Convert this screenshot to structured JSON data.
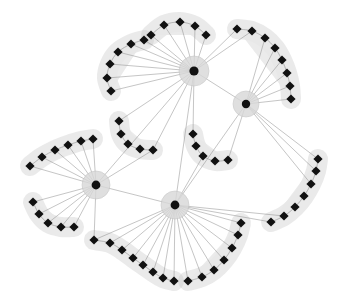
{
  "figure": {
    "title": "",
    "background_color": "#ffffff",
    "width": 350,
    "height": 308
  },
  "style": {
    "edge_color": "#8e8e8e",
    "edge_width": 0.55,
    "blob_fill": "#e8e8e8",
    "blob_stroke": "#c4c4c4",
    "node_color": "#111111",
    "node_size": 4.6,
    "hub_halo_color": "#d8d8d8",
    "hub_core_color": "#111111",
    "hub_core_radius": 4.2,
    "hub_halo_radius": 13
  },
  "chart_data": {
    "type": "scatter",
    "title": "",
    "xlabel": "",
    "ylabel": "",
    "xlim": [
      0,
      350
    ],
    "ylim": [
      0,
      308
    ],
    "grid": false,
    "legend": null,
    "counts": {
      "hubs": 4,
      "clusters": 10,
      "cluster_nodes": 64,
      "hub_hub_edges": 5
    },
    "hubs": [
      {
        "id": "H1",
        "label": "hub-top-center",
        "x": 194,
        "y": 71,
        "halo_r": 15,
        "core_r": 4.6
      },
      {
        "id": "H2",
        "label": "hub-right",
        "x": 246,
        "y": 104,
        "halo_r": 13,
        "core_r": 4.2
      },
      {
        "id": "H3",
        "label": "hub-left",
        "x": 96,
        "y": 185,
        "halo_r": 14,
        "core_r": 4.4
      },
      {
        "id": "H4",
        "label": "hub-bottom-center",
        "x": 175,
        "y": 205,
        "halo_r": 14,
        "core_r": 4.4
      }
    ],
    "hub_edges": [
      {
        "source": "H1",
        "target": "H2"
      },
      {
        "source": "H1",
        "target": "H3"
      },
      {
        "source": "H1",
        "target": "H4"
      },
      {
        "source": "H2",
        "target": "H4"
      },
      {
        "source": "H3",
        "target": "H4"
      }
    ],
    "clusters": [
      {
        "id": "C1",
        "label": "cluster-top-left",
        "attached_to": [
          "H1"
        ],
        "node_count": 6,
        "nodes": [
          [
            111,
            91
          ],
          [
            107,
            78
          ],
          [
            110,
            64
          ],
          [
            118,
            52
          ],
          [
            131,
            44
          ],
          [
            144,
            40
          ]
        ]
      },
      {
        "id": "C2",
        "label": "cluster-top-center",
        "attached_to": [
          "H1"
        ],
        "node_count": 5,
        "nodes": [
          [
            151,
            35
          ],
          [
            164,
            25
          ],
          [
            180,
            22
          ],
          [
            195,
            26
          ],
          [
            206,
            35
          ]
        ]
      },
      {
        "id": "C3",
        "label": "cluster-top-right",
        "attached_to": [
          "H1",
          "H2"
        ],
        "node_count": 8,
        "nodes": [
          [
            237,
            29
          ],
          [
            252,
            31
          ],
          [
            265,
            38
          ],
          [
            275,
            48
          ],
          [
            282,
            60
          ],
          [
            287,
            73
          ],
          [
            290,
            86
          ],
          [
            291,
            99
          ]
        ]
      },
      {
        "id": "C4",
        "label": "cluster-middle-left",
        "attached_to": [
          "H1",
          "H3"
        ],
        "node_count": 5,
        "nodes": [
          [
            119,
            121
          ],
          [
            121,
            134
          ],
          [
            128,
            144
          ],
          [
            140,
            149
          ],
          [
            153,
            150
          ]
        ]
      },
      {
        "id": "C5",
        "label": "cluster-middle-center",
        "attached_to": [
          "H1",
          "H2",
          "H4"
        ],
        "node_count": 5,
        "nodes": [
          [
            193,
            134
          ],
          [
            196,
            146
          ],
          [
            203,
            156
          ],
          [
            215,
            161
          ],
          [
            228,
            160
          ]
        ]
      },
      {
        "id": "C6",
        "label": "cluster-left-upper",
        "attached_to": [
          "H3"
        ],
        "node_count": 6,
        "nodes": [
          [
            30,
            166
          ],
          [
            42,
            157
          ],
          [
            55,
            150
          ],
          [
            68,
            145
          ],
          [
            81,
            141
          ],
          [
            93,
            139
          ]
        ]
      },
      {
        "id": "C7",
        "label": "cluster-left-lower",
        "attached_to": [
          "H3"
        ],
        "node_count": 5,
        "nodes": [
          [
            33,
            202
          ],
          [
            39,
            214
          ],
          [
            48,
            223
          ],
          [
            61,
            227
          ],
          [
            74,
            227
          ]
        ]
      },
      {
        "id": "C8",
        "label": "cluster-bottom-left",
        "attached_to": [
          "H3",
          "H4"
        ],
        "node_count": 8,
        "nodes": [
          [
            94,
            240
          ],
          [
            110,
            243
          ],
          [
            122,
            250
          ],
          [
            133,
            258
          ],
          [
            143,
            265
          ],
          [
            153,
            272
          ],
          [
            163,
            278
          ],
          [
            174,
            281
          ]
        ]
      },
      {
        "id": "C9",
        "label": "cluster-bottom-right",
        "attached_to": [
          "H4"
        ],
        "node_count": 7,
        "nodes": [
          [
            188,
            281
          ],
          [
            202,
            277
          ],
          [
            214,
            270
          ],
          [
            224,
            260
          ],
          [
            232,
            248
          ],
          [
            238,
            235
          ],
          [
            241,
            223
          ]
        ]
      },
      {
        "id": "C10",
        "label": "cluster-right",
        "attached_to": [
          "H2",
          "H4"
        ],
        "node_count": 7,
        "nodes": [
          [
            271,
            222
          ],
          [
            284,
            216
          ],
          [
            295,
            207
          ],
          [
            304,
            196
          ],
          [
            311,
            184
          ],
          [
            316,
            171
          ],
          [
            318,
            159
          ]
        ]
      }
    ],
    "hub_to_cluster_edges": [
      {
        "hub": "H1",
        "cluster": "C1",
        "node_indices": [
          0,
          1,
          2,
          3,
          4,
          5
        ]
      },
      {
        "hub": "H1",
        "cluster": "C2",
        "node_indices": [
          0,
          1,
          2,
          3,
          4
        ]
      },
      {
        "hub": "H1",
        "cluster": "C3",
        "node_indices": [
          0,
          1
        ]
      },
      {
        "hub": "H1",
        "cluster": "C4",
        "node_indices": [
          0,
          4
        ]
      },
      {
        "hub": "H1",
        "cluster": "C5",
        "node_indices": [
          0
        ]
      },
      {
        "hub": "H2",
        "cluster": "C3",
        "node_indices": [
          2,
          3,
          4,
          5,
          6,
          7
        ]
      },
      {
        "hub": "H2",
        "cluster": "C5",
        "node_indices": [
          4
        ]
      },
      {
        "hub": "H2",
        "cluster": "C10",
        "node_indices": [
          4,
          5,
          6
        ]
      },
      {
        "hub": "H3",
        "cluster": "C6",
        "node_indices": [
          0,
          1,
          2,
          3,
          4,
          5
        ]
      },
      {
        "hub": "H3",
        "cluster": "C7",
        "node_indices": [
          0,
          1,
          2,
          3,
          4
        ]
      },
      {
        "hub": "H3",
        "cluster": "C4",
        "node_indices": [
          4
        ]
      },
      {
        "hub": "H3",
        "cluster": "C8",
        "node_indices": [
          0
        ]
      },
      {
        "hub": "H4",
        "cluster": "C8",
        "node_indices": [
          0,
          1,
          2,
          3,
          4,
          5,
          6,
          7
        ]
      },
      {
        "hub": "H4",
        "cluster": "C9",
        "node_indices": [
          0,
          1,
          2,
          3,
          4,
          5,
          6
        ]
      },
      {
        "hub": "H4",
        "cluster": "C5",
        "node_indices": [
          2
        ]
      },
      {
        "hub": "H4",
        "cluster": "C10",
        "node_indices": [
          0,
          1
        ]
      }
    ]
  }
}
